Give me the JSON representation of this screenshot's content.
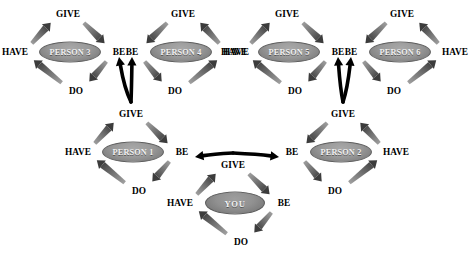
{
  "diagram": {
    "verbs": {
      "give": "GIVE",
      "be": "BE",
      "do": "DO",
      "have": "HAVE"
    },
    "colors": {
      "background": "#ffffff",
      "node_fill": "#8c8c8c",
      "node_text": "#f2f2f2",
      "verb_text": "#000000",
      "cycle_arrow": "#595959",
      "link_arrow": "#000000"
    },
    "nodes": [
      {
        "id": "you",
        "label": "YOU",
        "cx": 235,
        "cy": 203,
        "orientation": "normal"
      },
      {
        "id": "person1",
        "label": "PERSON 1",
        "cx": 133,
        "cy": 152,
        "orientation": "normal"
      },
      {
        "id": "person2",
        "label": "PERSON 2",
        "cx": 341,
        "cy": 152,
        "orientation": "mirrored"
      },
      {
        "id": "person3",
        "label": "PERSON 3",
        "cx": 70,
        "cy": 52,
        "orientation": "normal"
      },
      {
        "id": "person4",
        "label": "PERSON 4",
        "cx": 181,
        "cy": 52,
        "orientation": "mirrored"
      },
      {
        "id": "person5",
        "label": "PERSON 5",
        "cx": 289,
        "cy": 52,
        "orientation": "normal"
      },
      {
        "id": "person6",
        "label": "PERSON 6",
        "cx": 400,
        "cy": 52,
        "orientation": "mirrored"
      }
    ],
    "links": [
      {
        "from": "you",
        "from_verb": "GIVE",
        "to": "person1",
        "to_verb": "BE"
      },
      {
        "from": "you",
        "from_verb": "GIVE",
        "to": "person2",
        "to_verb": "BE"
      },
      {
        "from": "person1",
        "from_verb": "GIVE",
        "to": "person3",
        "to_verb": "BE"
      },
      {
        "from": "person1",
        "from_verb": "GIVE",
        "to": "person4",
        "to_verb": "BE"
      },
      {
        "from": "person2",
        "from_verb": "GIVE",
        "to": "person5",
        "to_verb": "BE"
      },
      {
        "from": "person2",
        "from_verb": "GIVE",
        "to": "person6",
        "to_verb": "BE"
      }
    ],
    "cycle_order": [
      "GIVE",
      "BE",
      "DO",
      "HAVE"
    ]
  }
}
